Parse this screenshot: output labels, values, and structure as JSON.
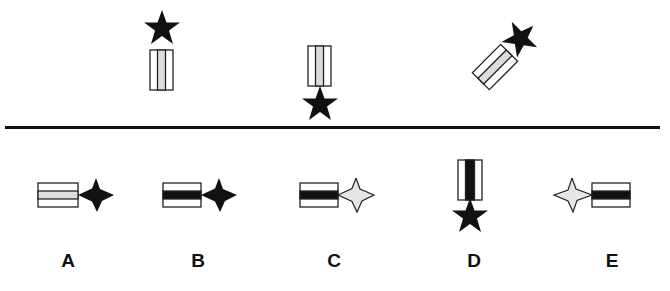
{
  "puzzle": {
    "sequence": [
      {
        "id": "seq-1",
        "ribbon_center": "gray",
        "star_fill": "black",
        "star_position": "top",
        "rotation_deg": 0
      },
      {
        "id": "seq-2",
        "ribbon_center": "gray",
        "star_fill": "black",
        "star_position": "bottom",
        "rotation_deg": 0
      },
      {
        "id": "seq-3",
        "ribbon_center": "gray",
        "star_fill": "black",
        "star_position": "top-right",
        "rotation_deg": 45
      }
    ],
    "options": [
      {
        "label": "A",
        "ribbon_center": "gray",
        "star_fill": "black",
        "star_position": "right"
      },
      {
        "label": "B",
        "ribbon_center": "black",
        "star_fill": "black",
        "star_position": "right"
      },
      {
        "label": "C",
        "ribbon_center": "black",
        "star_fill": "light-gray",
        "star_position": "right"
      },
      {
        "label": "D",
        "ribbon_center": "black",
        "star_fill": "black",
        "star_position": "bottom"
      },
      {
        "label": "E",
        "ribbon_center": "black",
        "star_fill": "light-gray",
        "star_position": "left"
      }
    ]
  },
  "colors": {
    "black": "#111111",
    "gray": "#dcdcdc",
    "light_gray": "#e6e6e6",
    "outline": "#222222",
    "background": "#ffffff"
  }
}
